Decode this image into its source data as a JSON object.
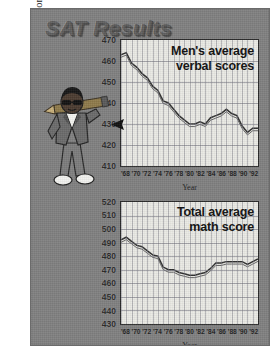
{
  "source_credit": "Source: Copyright 1993. USA TODAY. Reprinted with permission.",
  "headline": "SAT Results",
  "illustration": {
    "name": "cartoon-student-with-pencil",
    "description": "Cartoon figure in jacket and sunglasses carrying a giant pencil over the shoulder"
  },
  "colors": {
    "panel_background": "#808080",
    "plot_background": "#e9e9e4",
    "line": "#2f2f2f",
    "grid": "#787882",
    "text": "#101010",
    "headline": "#5e5e5e"
  },
  "chart_data": [
    {
      "id": "verbal",
      "type": "line",
      "title": "Men's average\nverbal scores",
      "title_line1": "Men's average",
      "title_line2": "verbal scores",
      "xlabel": "Year",
      "ylabel": "",
      "ylim": [
        410,
        470
      ],
      "yticks": [
        470,
        460,
        450,
        440,
        430,
        420,
        410
      ],
      "xlim": [
        1967,
        1993
      ],
      "xticks": [
        "'68",
        "'70",
        "'72",
        "'74",
        "'76",
        "'78",
        "'80",
        "'82",
        "'84",
        "'86",
        "'88",
        "'90",
        "'92"
      ],
      "grid": true,
      "legend": "none",
      "x": [
        1967,
        1968,
        1969,
        1970,
        1971,
        1972,
        1973,
        1974,
        1975,
        1976,
        1977,
        1978,
        1979,
        1980,
        1981,
        1982,
        1983,
        1984,
        1985,
        1986,
        1987,
        1988,
        1989,
        1990,
        1991,
        1992,
        1993
      ],
      "values": [
        463,
        464,
        459,
        457,
        454,
        452,
        448,
        446,
        441,
        440,
        437,
        434,
        432,
        430,
        430,
        431,
        430,
        433,
        434,
        435,
        437,
        435,
        434,
        429,
        426,
        428,
        428
      ]
    },
    {
      "id": "math",
      "type": "line",
      "title": "Total average\nmath score",
      "title_line1": "Total average",
      "title_line2": "math score",
      "xlabel": "Year",
      "ylabel": "",
      "ylim": [
        430,
        520
      ],
      "yticks": [
        520,
        510,
        500,
        490,
        480,
        470,
        460,
        450,
        440,
        430
      ],
      "xlim": [
        1967,
        1993
      ],
      "xticks": [
        "'68",
        "'70",
        "'72",
        "'74",
        "'76",
        "'78",
        "'80",
        "'82",
        "'84",
        "'86",
        "'88",
        "'90",
        "'92"
      ],
      "grid": true,
      "legend": "none",
      "x": [
        1967,
        1968,
        1969,
        1970,
        1971,
        1972,
        1973,
        1974,
        1975,
        1976,
        1977,
        1978,
        1979,
        1980,
        1981,
        1982,
        1983,
        1984,
        1985,
        1986,
        1987,
        1988,
        1989,
        1990,
        1991,
        1992,
        1993
      ],
      "values": [
        492,
        494,
        491,
        488,
        487,
        484,
        481,
        480,
        472,
        470,
        470,
        468,
        467,
        466,
        466,
        467,
        468,
        471,
        475,
        475,
        476,
        476,
        476,
        476,
        474,
        476,
        478
      ]
    }
  ]
}
